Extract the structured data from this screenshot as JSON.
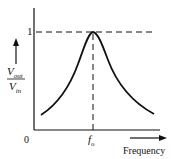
{
  "figure": {
    "type": "resonance-curve",
    "y_axis_label_numerator": "V",
    "y_axis_label_numerator_sub": "out",
    "y_axis_label_denominator": "V",
    "y_axis_label_denominator_sub": "in",
    "x_axis_label": "Frequency",
    "origin_label": "0",
    "peak_y_tick_label": "1",
    "peak_x_tick_label": "f",
    "peak_x_tick_sub": "o",
    "colors": {
      "line": "#111111",
      "background": "#ffffff"
    }
  }
}
